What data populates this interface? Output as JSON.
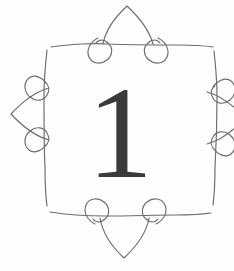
{
  "page": {
    "kind": "decorative-ornament-illustration",
    "width": 234,
    "height": 271,
    "background_color": "#fefefe"
  },
  "ornament": {
    "name": "scalloped-loop-frame",
    "stroke_color": "#6b6b70",
    "stroke_width": 1.15,
    "fill": "none",
    "arch_count": 4,
    "loop_count": 8,
    "cropped_edge": "right"
  },
  "numeral": {
    "value": "1",
    "color": "#3a3a3a",
    "font_size_px": 132,
    "style": "serif"
  }
}
